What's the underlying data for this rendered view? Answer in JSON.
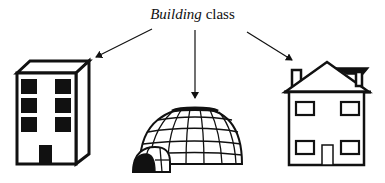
{
  "diagram": {
    "title": {
      "italic_part": "Building",
      "regular_part": " class"
    },
    "instances": [
      {
        "label": "office-building",
        "description": "Tall rectangular building with six black windows and a black door"
      },
      {
        "label": "igloo",
        "description": "Dome of ice blocks with a black top cap and a tunnel entrance"
      },
      {
        "label": "house",
        "description": "Two-story house with gabled roof, chimney, four windows and a door"
      }
    ],
    "arrows": [
      {
        "from": "title",
        "to": "office-building"
      },
      {
        "from": "title",
        "to": "igloo"
      },
      {
        "from": "title",
        "to": "house"
      }
    ],
    "colors": {
      "ink": "#111111",
      "background": "#ffffff"
    }
  }
}
